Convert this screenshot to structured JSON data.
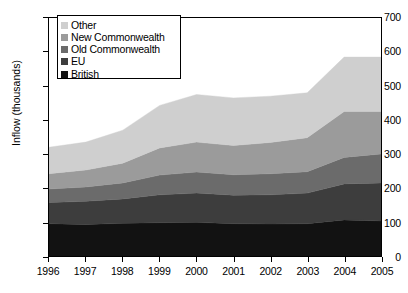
{
  "chart_data": {
    "type": "area",
    "stacked": true,
    "title": "",
    "xlabel": "",
    "ylabel": "Inflow (thousands)",
    "x": [
      1996,
      1997,
      1998,
      1999,
      2000,
      2001,
      2002,
      2003,
      2004,
      2005
    ],
    "xticklabels": [
      "1996",
      "1997",
      "1998",
      "1999",
      "2000",
      "2001",
      "2002",
      "2003",
      "2004",
      "2005"
    ],
    "yticklabels": [
      "0",
      "100",
      "200",
      "300",
      "400",
      "500",
      "600",
      "700"
    ],
    "yticks": [
      0,
      100,
      200,
      300,
      400,
      500,
      600,
      700
    ],
    "ylim": [
      0,
      700
    ],
    "xlim": [
      1996,
      2005
    ],
    "grid": false,
    "legend_position": "upper-left",
    "series": [
      {
        "name": "British",
        "color": "#121212",
        "values": [
          95,
          93,
          96,
          98,
          99,
          95,
          94,
          95,
          106,
          103
        ]
      },
      {
        "name": "EU",
        "color": "#3d3d3d",
        "values": [
          62,
          68,
          72,
          82,
          86,
          84,
          86,
          90,
          106,
          112
        ]
      },
      {
        "name": "Old Commonwealth",
        "color": "#6b6b6b",
        "values": [
          40,
          42,
          47,
          58,
          62,
          60,
          62,
          63,
          78,
          85
        ]
      },
      {
        "name": "New Commonwealth",
        "color": "#9b9b9b",
        "values": [
          45,
          50,
          58,
          80,
          88,
          86,
          92,
          100,
          135,
          125
        ]
      },
      {
        "name": "Other",
        "color": "#cfcfcf",
        "values": [
          78,
          82,
          97,
          125,
          140,
          140,
          136,
          132,
          160,
          160
        ]
      }
    ],
    "cumulative_totals": [
      320,
      335,
      370,
      443,
      475,
      465,
      470,
      480,
      585,
      585
    ]
  },
  "legend": {
    "entries": [
      {
        "label": "Other",
        "color": "#cfcfcf"
      },
      {
        "label": "New Commonwealth",
        "color": "#9b9b9b"
      },
      {
        "label": "Old Commonwealth",
        "color": "#6b6b6b"
      },
      {
        "label": "EU",
        "color": "#3d3d3d"
      },
      {
        "label": "British",
        "color": "#121212"
      }
    ]
  }
}
